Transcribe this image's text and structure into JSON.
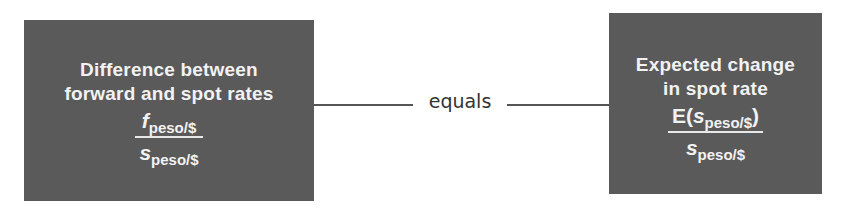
{
  "left_box": {
    "title_line1": "Difference between",
    "title_line2": "forward and spot rates",
    "numerator_var": "f",
    "numerator_sub": "peso/$",
    "denominator_var": "s",
    "denominator_sub": "peso/$"
  },
  "connector": {
    "label": "equals"
  },
  "right_box": {
    "title_line1": "Expected change",
    "title_line2": "in spot rate",
    "numerator_prefix": "E(",
    "numerator_var": "s",
    "numerator_sub": "peso/$",
    "numerator_suffix": ")",
    "denominator_var": "s",
    "denominator_sub": "peso/$"
  },
  "colors": {
    "box_fill": "#5a5a5a",
    "box_text": "#f2f2f2",
    "connector": "#555555"
  }
}
